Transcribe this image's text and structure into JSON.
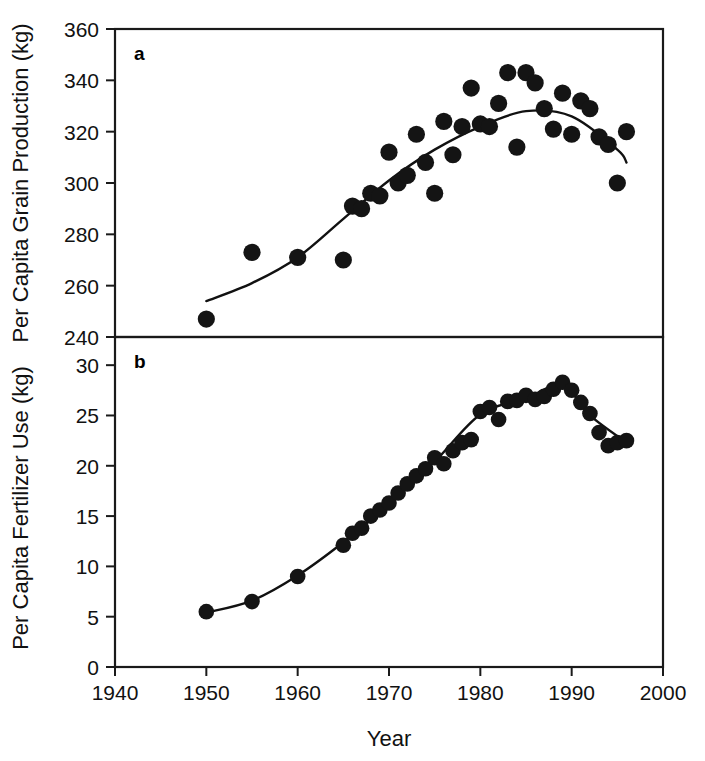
{
  "figure": {
    "background": "#ffffff",
    "ink_color": "#141414",
    "x_axis": {
      "label": "Year",
      "ticks": [
        1940,
        1950,
        1960,
        1970,
        1980,
        1990,
        2000
      ],
      "tick_labels": [
        "1940",
        "1950",
        "1960",
        "1970",
        "1980",
        "1990",
        "2000"
      ],
      "range": [
        1940,
        2000
      ]
    },
    "panels": [
      {
        "key": "a",
        "label": "a",
        "y_label": "Per Capita Grain Production (kg)",
        "y_ticks": [
          240,
          260,
          280,
          300,
          320,
          340,
          360
        ],
        "y_tick_labels": [
          "240",
          "260",
          "280",
          "300",
          "320",
          "340",
          "360"
        ],
        "y_range": [
          240,
          360
        ]
      },
      {
        "key": "b",
        "label": "b",
        "y_label": "Per Capita Fertilizer Use (kg)",
        "y_ticks": [
          0,
          5,
          10,
          15,
          20,
          25,
          30
        ],
        "y_tick_labels": [
          "0",
          "5",
          "10",
          "15",
          "20",
          "25",
          "30"
        ],
        "y_range": [
          0,
          32.8
        ]
      }
    ]
  },
  "chart_data": [
    {
      "type": "scatter",
      "panel": "a",
      "title": "a",
      "xlabel": "Year",
      "ylabel": "Per Capita Grain Production (kg)",
      "xlim": [
        1940,
        2000
      ],
      "ylim": [
        240,
        360
      ],
      "grid": false,
      "legend": "none",
      "series": [
        {
          "name": "Per capita grain production",
          "marker": "filled-circle",
          "x": [
            1950,
            1955,
            1960,
            1965,
            1966,
            1967,
            1968,
            1969,
            1970,
            1971,
            1972,
            1973,
            1974,
            1975,
            1976,
            1977,
            1978,
            1979,
            1980,
            1981,
            1982,
            1983,
            1984,
            1985,
            1986,
            1987,
            1988,
            1989,
            1990,
            1991,
            1992,
            1993,
            1994,
            1995,
            1996
          ],
          "y": [
            247,
            273,
            271,
            270,
            291,
            290,
            296,
            295,
            312,
            300,
            303,
            319,
            308,
            296,
            324,
            311,
            322,
            337,
            323,
            322,
            331,
            343,
            314,
            343,
            339,
            329,
            321,
            335,
            319,
            332,
            329,
            318,
            315,
            300,
            320
          ]
        },
        {
          "name": "Fitted trend (polynomial)",
          "type": "line",
          "x": [
            1950,
            1955,
            1960,
            1965,
            1970,
            1975,
            1980,
            1985,
            1990,
            1995,
            1996
          ],
          "y": [
            254,
            261,
            271,
            286,
            301,
            313,
            322,
            328,
            326,
            313,
            308
          ]
        }
      ]
    },
    {
      "type": "scatter",
      "panel": "b",
      "title": "b",
      "xlabel": "Year",
      "ylabel": "Per Capita Fertilizer Use (kg)",
      "xlim": [
        1940,
        2000
      ],
      "ylim": [
        0,
        32.8
      ],
      "grid": false,
      "legend": "none",
      "series": [
        {
          "name": "Per capita fertilizer use",
          "marker": "filled-circle",
          "x": [
            1950,
            1955,
            1960,
            1965,
            1966,
            1967,
            1968,
            1969,
            1970,
            1971,
            1972,
            1973,
            1974,
            1975,
            1976,
            1977,
            1978,
            1979,
            1980,
            1981,
            1982,
            1983,
            1984,
            1985,
            1986,
            1987,
            1988,
            1989,
            1990,
            1991,
            1992,
            1993,
            1994,
            1995,
            1996
          ],
          "y": [
            5.5,
            6.5,
            9.0,
            12.1,
            13.3,
            13.8,
            15.0,
            15.6,
            16.3,
            17.3,
            18.2,
            19.0,
            19.7,
            20.8,
            20.2,
            21.5,
            22.3,
            22.6,
            25.4,
            25.8,
            24.6,
            26.4,
            26.5,
            27.0,
            26.6,
            26.9,
            27.6,
            28.3,
            27.5,
            26.3,
            25.2,
            23.3,
            22.0,
            22.3,
            22.5
          ]
        },
        {
          "name": "Fitted trend (smoothed)",
          "type": "line",
          "x": [
            1950,
            1955,
            1960,
            1965,
            1970,
            1975,
            1980,
            1985,
            1989,
            1992,
            1996
          ],
          "y": [
            5.4,
            6.6,
            9.1,
            12.4,
            16.2,
            20.4,
            25.1,
            26.7,
            28.0,
            25.0,
            22.3
          ]
        }
      ]
    }
  ]
}
